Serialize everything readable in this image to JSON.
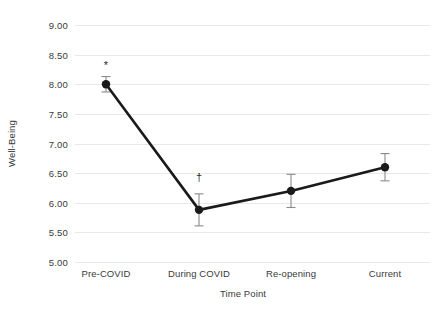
{
  "chart_data": {
    "type": "line",
    "title": "",
    "xlabel": "Time Point",
    "ylabel": "Well-Being",
    "categories": [
      "Pre-COVID",
      "During COVID",
      "Re-opening",
      "Current"
    ],
    "values": [
      8.0,
      5.88,
      6.2,
      6.6
    ],
    "error_bars": {
      "type": "symmetric",
      "values": [
        0.13,
        0.27,
        0.28,
        0.23
      ]
    },
    "series": [
      {
        "name": "Well-Being",
        "values": [
          8.0,
          5.88,
          6.2,
          6.6
        ],
        "errors": [
          0.13,
          0.27,
          0.28,
          0.23
        ],
        "color": "#1a1a1a",
        "marker": "circle",
        "line_width": 2.6
      }
    ],
    "annotations": [
      {
        "text": "*",
        "category": "Pre-COVID",
        "value": 8.0,
        "offset_y": 0.33
      },
      {
        "text": "†",
        "category": "During COVID",
        "value": 5.88,
        "offset_y": 0.56
      }
    ],
    "ylim": [
      5.0,
      9.0
    ],
    "yticks": [
      5.0,
      5.5,
      6.0,
      6.5,
      7.0,
      7.5,
      8.0,
      8.5,
      9.0
    ],
    "ytick_labels": [
      "5.00",
      "5.50",
      "6.00",
      "6.50",
      "7.00",
      "7.50",
      "8.00",
      "8.50",
      "9.00"
    ],
    "grid": true,
    "grid_axis": "y",
    "grid_color": "#e8e8e8",
    "legend": false,
    "legend_position": "none",
    "background_color": "#ffffff",
    "text_color": "#3a3a3a"
  },
  "axes": {
    "y_title": "Well-Being",
    "x_title": "Time Point"
  }
}
